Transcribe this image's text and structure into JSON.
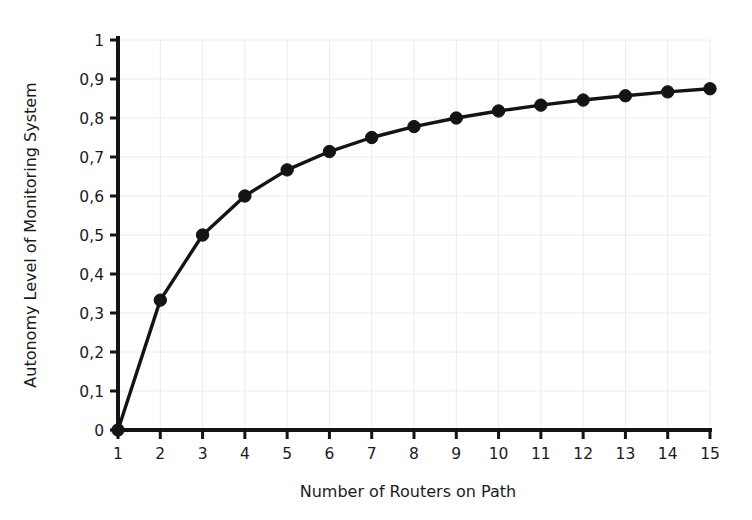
{
  "chart_data": {
    "type": "line",
    "title": "",
    "xlabel": "Number of Routers on Path",
    "ylabel": "Autonomy Level of Monitoring System",
    "x": [
      1,
      2,
      3,
      4,
      5,
      6,
      7,
      8,
      9,
      10,
      11,
      12,
      13,
      14,
      15
    ],
    "values": [
      0,
      0.333,
      0.5,
      0.6,
      0.667,
      0.714,
      0.75,
      0.778,
      0.8,
      0.818,
      0.833,
      0.846,
      0.857,
      0.867,
      0.875
    ],
    "series": [
      {
        "name": "Autonomy Level",
        "values": [
          0,
          0.333,
          0.5,
          0.6,
          0.667,
          0.714,
          0.75,
          0.778,
          0.8,
          0.818,
          0.833,
          0.846,
          0.857,
          0.867,
          0.875
        ]
      }
    ],
    "xlim": [
      1,
      15
    ],
    "ylim": [
      0,
      1
    ],
    "grid": true,
    "legend": false,
    "legend_position": "none",
    "decimal_separator": ",",
    "marker": "filled-circle",
    "line_color": "#141414",
    "marker_color": "#141414",
    "grid_color": "#ececed",
    "axis_color": "#141414",
    "background_color": "#ffffff",
    "x_tick_labels": [
      "1",
      "2",
      "3",
      "4",
      "5",
      "6",
      "7",
      "8",
      "9",
      "10",
      "11",
      "12",
      "13",
      "14",
      "15"
    ],
    "y_tick_labels": [
      "0",
      "0,1",
      "0,2",
      "0,3",
      "0,4",
      "0,5",
      "0,6",
      "0,7",
      "0,8",
      "0,9",
      "1"
    ],
    "y_tick_values": [
      0,
      0.1,
      0.2,
      0.3,
      0.4,
      0.5,
      0.6,
      0.7,
      0.8,
      0.9,
      1
    ]
  }
}
